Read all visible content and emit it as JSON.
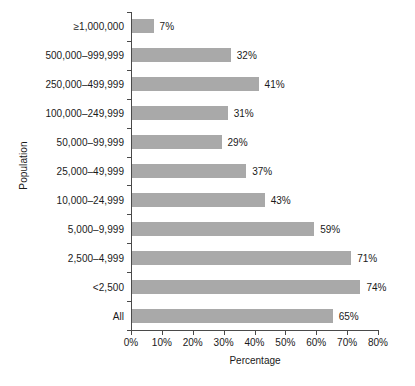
{
  "chart_data": {
    "type": "bar",
    "orientation": "horizontal",
    "title": "",
    "xlabel": "Percentage",
    "ylabel": "Population",
    "xlim": [
      0,
      80
    ],
    "xticks": [
      0,
      10,
      20,
      30,
      40,
      50,
      60,
      70,
      80
    ],
    "xtick_labels": [
      "0%",
      "10%",
      "20%",
      "30%",
      "40%",
      "50%",
      "60%",
      "70%",
      "80%"
    ],
    "grid": false,
    "legend": false,
    "bar_color": "#a9a9a9",
    "axis_color": "#4a4a4a",
    "categories": [
      "≥1,000,000",
      "500,000–999,999",
      "250,000–499,999",
      "100,000–249,999",
      "50,000–99,999",
      "25,000–49,999",
      "10,000–24,999",
      "5,000–9,999",
      "2,500–4,999",
      "<2,500",
      "All"
    ],
    "values": [
      7,
      32,
      41,
      31,
      29,
      37,
      43,
      59,
      71,
      74,
      65
    ],
    "data_labels": [
      "7%",
      "32%",
      "41%",
      "31%",
      "29%",
      "37%",
      "43%",
      "59%",
      "71%",
      "74%",
      "65%"
    ]
  }
}
